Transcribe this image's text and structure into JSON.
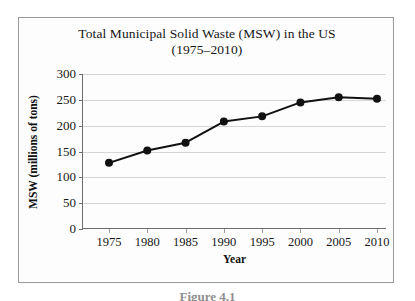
{
  "figure": {
    "caption": "Figure 4.1"
  },
  "chart_data": {
    "type": "line",
    "title_line1": "Total Municipal Solid Waste (MSW) in the US",
    "title_line2": "(1975–2010)",
    "xlabel": "Year",
    "ylabel": "MSW (millions of tons)",
    "categories": [
      1975,
      1980,
      1985,
      1990,
      1995,
      2000,
      2005,
      2010
    ],
    "x_tick_labels": [
      "1975",
      "1980",
      "1985",
      "1990",
      "1995",
      "2000",
      "2005",
      "2010"
    ],
    "values": [
      128,
      152,
      167,
      208,
      218,
      245,
      255,
      252
    ],
    "y_ticks": [
      0,
      50,
      100,
      150,
      200,
      250,
      300
    ],
    "y_tick_labels": [
      "0",
      "50",
      "100",
      "150",
      "200",
      "250",
      "300"
    ],
    "ylim": [
      0,
      300
    ],
    "xlim": [
      1975,
      2010
    ],
    "grid": "horizontal",
    "legend": "none",
    "series_color": "#111111",
    "marker": "circle",
    "gridline_color": "#d6d6d6",
    "axis_color": "#6e6e6e"
  }
}
